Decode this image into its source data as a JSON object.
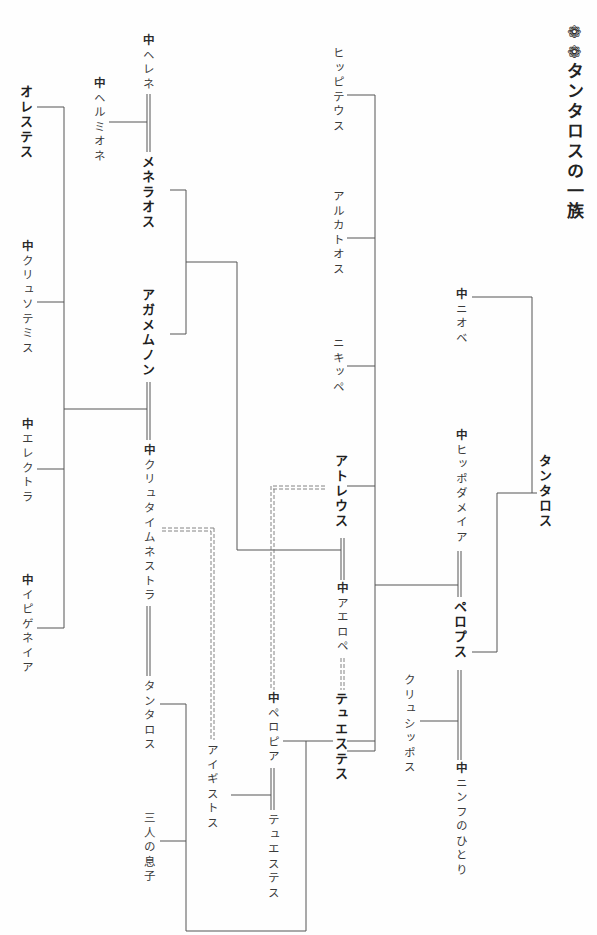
{
  "title": {
    "mark_icon": "❁❁",
    "text": "タンタロスの一族"
  },
  "legend": {
    "female_marker": "♀",
    "female_marker_glyph": "中",
    "marriage_line": "double-line",
    "illicit_union_line": "dashed-double-line"
  },
  "persons": {
    "tantalus": {
      "label": "タンタロス",
      "bold": true,
      "female": false
    },
    "niobe": {
      "label": "ニオベ",
      "bold": false,
      "female": true
    },
    "hippodamia": {
      "label": "ヒッポダメイア",
      "bold": false,
      "female": true
    },
    "pelops": {
      "label": "ペロプス",
      "bold": true,
      "female": false
    },
    "chrysippus": {
      "label": "クリュシッポス",
      "bold": false,
      "female": false
    },
    "nymph": {
      "label": "ニンフのひとり",
      "bold": false,
      "female": true
    },
    "hippitheus": {
      "label": "ヒッピテウス",
      "bold": false,
      "female": false
    },
    "alcathous": {
      "label": "アルカトオス",
      "bold": false,
      "female": false
    },
    "nicippe": {
      "label": "ニキッペ",
      "bold": false,
      "female": false
    },
    "atreus": {
      "label": "アトレウス",
      "bold": true,
      "female": false
    },
    "aerope": {
      "label": "アエロペ",
      "bold": false,
      "female": true
    },
    "thyestes": {
      "label": "テュエステス",
      "bold": true,
      "female": false
    },
    "pelopia": {
      "label": "ペロピア",
      "bold": false,
      "female": true
    },
    "aegisthus": {
      "label": "アイギストス",
      "bold": false,
      "female": false
    },
    "thyestes_son": {
      "label": "テュエステス",
      "bold": false,
      "female": false
    },
    "helen": {
      "label": "ヘレネ",
      "bold": false,
      "female": true
    },
    "hermione": {
      "label": "ヘルミオネ",
      "bold": false,
      "female": true
    },
    "menelaus": {
      "label": "メネラオス",
      "bold": true,
      "female": false
    },
    "agamemnon": {
      "label": "アガメムノン",
      "bold": true,
      "female": false
    },
    "clytemnestra": {
      "label": "クリュタイムネストラ",
      "bold": false,
      "female": true
    },
    "tantalus_jr": {
      "label": "タンタロス",
      "bold": false,
      "female": false
    },
    "three_sons": {
      "label": "三人の息子",
      "bold": false,
      "female": false
    },
    "orestes": {
      "label": "オレステス",
      "bold": true,
      "female": false
    },
    "chrysothemis": {
      "label": "クリュソテミス",
      "bold": false,
      "female": true
    },
    "electra": {
      "label": "エレクトラ",
      "bold": false,
      "female": true
    },
    "iphigenia": {
      "label": "イピゲネイア",
      "bold": false,
      "female": true
    }
  },
  "colors": {
    "line": "#555555",
    "text": "#2a2a2a",
    "background": "#fefefe"
  }
}
